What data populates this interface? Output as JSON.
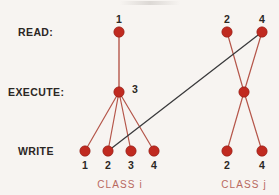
{
  "figure": {
    "background_color": "#f7f4f1",
    "node_color": "#c02a20",
    "node_stroke_color": "#8f1d16",
    "red_edge_color": "#b5564a",
    "dark_edge_color": "#3a3a3c",
    "label_color": "#2b2724",
    "caption_color": "#b8695f"
  },
  "row_labels": [
    {
      "id": "read",
      "text": "READ:",
      "x": 18,
      "y": 32
    },
    {
      "id": "execute",
      "text": "EXECUTE:",
      "x": 8,
      "y": 92
    },
    {
      "id": "write",
      "text": "WRITE",
      "x": 18,
      "y": 151
    }
  ],
  "nodes": [
    {
      "id": "i-read-1",
      "class": "i",
      "row": "read",
      "label": "1",
      "label_pos": "above",
      "x": 119,
      "y": 32
    },
    {
      "id": "i-execute-3",
      "class": "i",
      "row": "execute",
      "label": "3",
      "label_pos": "right",
      "x": 119,
      "y": 92
    },
    {
      "id": "i-write-1",
      "class": "i",
      "row": "write",
      "label": "1",
      "label_pos": "below",
      "x": 85,
      "y": 151
    },
    {
      "id": "i-write-2",
      "class": "i",
      "row": "write",
      "label": "2",
      "label_pos": "below",
      "x": 108,
      "y": 151
    },
    {
      "id": "i-write-3",
      "class": "i",
      "row": "write",
      "label": "3",
      "label_pos": "below",
      "x": 131,
      "y": 151
    },
    {
      "id": "i-write-4",
      "class": "i",
      "row": "write",
      "label": "4",
      "label_pos": "below",
      "x": 154,
      "y": 151
    },
    {
      "id": "j-read-2",
      "class": "j",
      "row": "read",
      "label": "2",
      "label_pos": "above",
      "x": 227,
      "y": 32
    },
    {
      "id": "j-read-4",
      "class": "j",
      "row": "read",
      "label": "4",
      "label_pos": "above",
      "x": 262,
      "y": 32
    },
    {
      "id": "j-execute",
      "class": "j",
      "row": "execute",
      "label": "",
      "label_pos": "none",
      "x": 244,
      "y": 92
    },
    {
      "id": "j-write-2",
      "class": "j",
      "row": "write",
      "label": "2",
      "label_pos": "below",
      "x": 227,
      "y": 151
    },
    {
      "id": "j-write-4",
      "class": "j",
      "row": "write",
      "label": "4",
      "label_pos": "below",
      "x": 262,
      "y": 151
    }
  ],
  "edges": [
    {
      "id": "e-i-read1-exec3",
      "from": "i-read-1",
      "to": "i-execute-3",
      "color": "#b5564a",
      "width": 1.4
    },
    {
      "id": "e-i-exec3-write1",
      "from": "i-execute-3",
      "to": "i-write-1",
      "color": "#b5564a",
      "width": 1.2
    },
    {
      "id": "e-i-exec3-write2",
      "from": "i-execute-3",
      "to": "i-write-2",
      "color": "#b5564a",
      "width": 1.2
    },
    {
      "id": "e-i-exec3-write3",
      "from": "i-execute-3",
      "to": "i-write-3",
      "color": "#b5564a",
      "width": 1.2
    },
    {
      "id": "e-i-exec3-write4",
      "from": "i-execute-3",
      "to": "i-write-4",
      "color": "#b5564a",
      "width": 1.2
    },
    {
      "id": "e-j-read2-exec",
      "from": "j-read-2",
      "to": "j-execute",
      "color": "#b5564a",
      "width": 1.2
    },
    {
      "id": "e-j-read4-exec",
      "from": "j-read-4",
      "to": "j-execute",
      "color": "#b5564a",
      "width": 1.2
    },
    {
      "id": "e-j-exec-write2",
      "from": "j-execute",
      "to": "j-write-2",
      "color": "#b5564a",
      "width": 1.2
    },
    {
      "id": "e-j-exec-write4",
      "from": "j-execute",
      "to": "j-write-4",
      "color": "#b5564a",
      "width": 1.2
    },
    {
      "id": "e-cross-iwrite2-jread4",
      "from": "i-write-2",
      "to": "j-read-4",
      "color": "#3a3a3c",
      "width": 1.3
    }
  ],
  "captions": [
    {
      "id": "class-i",
      "text": "CLASS  i",
      "x": 120,
      "y": 180
    },
    {
      "id": "class-j",
      "text": "CLASS  j",
      "x": 244,
      "y": 180
    }
  ],
  "node_radius": 5.2
}
